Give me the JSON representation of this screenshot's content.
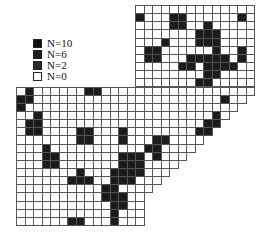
{
  "legend": [
    {
      "label": "N=10",
      "color": "#111111"
    },
    {
      "label": "N=6",
      "color": "#1e1e1e"
    },
    {
      "label": "N=2",
      "color": "#2a2a2a"
    },
    {
      "label": "N=0",
      "color": "#ffffff"
    }
  ],
  "grid": {
    "origin_x": 16,
    "origin_y": 5,
    "cell_w": 8.5,
    "cell_h": 8.15,
    "rows": [
      [
        14,
        27
      ],
      [
        14,
        27
      ],
      [
        14,
        27
      ],
      [
        14,
        27
      ],
      [
        14,
        27
      ],
      [
        14,
        27
      ],
      [
        14,
        27
      ],
      [
        14,
        27
      ],
      [
        14,
        27
      ],
      [
        14,
        27
      ],
      [
        0,
        27
      ],
      [
        0,
        26
      ],
      [
        0,
        25
      ],
      [
        0,
        24
      ],
      [
        0,
        23
      ],
      [
        0,
        22
      ],
      [
        0,
        21
      ],
      [
        0,
        20
      ],
      [
        0,
        19
      ],
      [
        0,
        18
      ],
      [
        0,
        17
      ],
      [
        0,
        16
      ],
      [
        0,
        15
      ],
      [
        0,
        14
      ],
      [
        0,
        14
      ],
      [
        0,
        14
      ],
      [
        0,
        14
      ]
    ],
    "dark": [
      [
        1,
        14
      ],
      [
        1,
        18
      ],
      [
        1,
        19
      ],
      [
        1,
        26
      ],
      [
        2,
        18
      ],
      [
        2,
        19
      ],
      [
        2,
        22
      ],
      [
        3,
        21
      ],
      [
        3,
        22
      ],
      [
        3,
        23
      ],
      [
        4,
        17
      ],
      [
        4,
        21
      ],
      [
        4,
        22
      ],
      [
        4,
        23
      ],
      [
        5,
        15
      ],
      [
        5,
        16
      ],
      [
        5,
        23
      ],
      [
        5,
        26
      ],
      [
        6,
        15
      ],
      [
        6,
        16
      ],
      [
        6,
        20
      ],
      [
        6,
        21
      ],
      [
        6,
        22
      ],
      [
        6,
        23
      ],
      [
        6,
        24
      ],
      [
        6,
        26
      ],
      [
        7,
        19
      ],
      [
        7,
        20
      ],
      [
        7,
        22
      ],
      [
        7,
        23
      ],
      [
        7,
        24
      ],
      [
        7,
        25
      ],
      [
        8,
        22
      ],
      [
        8,
        23
      ],
      [
        9,
        21
      ],
      [
        9,
        22
      ],
      [
        10,
        1
      ],
      [
        10,
        8
      ],
      [
        10,
        9
      ],
      [
        11,
        0
      ],
      [
        11,
        1
      ],
      [
        11,
        24
      ],
      [
        12,
        0
      ],
      [
        13,
        2
      ],
      [
        13,
        23
      ],
      [
        14,
        1
      ],
      [
        14,
        2
      ],
      [
        14,
        22
      ],
      [
        14,
        23
      ],
      [
        15,
        1
      ],
      [
        15,
        2
      ],
      [
        15,
        7
      ],
      [
        15,
        8
      ],
      [
        15,
        12
      ],
      [
        15,
        21
      ],
      [
        15,
        22
      ],
      [
        16,
        7
      ],
      [
        16,
        8
      ],
      [
        16,
        12
      ],
      [
        16,
        16
      ],
      [
        16,
        17
      ],
      [
        17,
        3
      ],
      [
        17,
        15
      ],
      [
        17,
        16
      ],
      [
        17,
        22
      ],
      [
        18,
        3
      ],
      [
        18,
        4
      ],
      [
        18,
        12
      ],
      [
        18,
        13
      ],
      [
        18,
        14
      ],
      [
        18,
        16
      ],
      [
        19,
        3
      ],
      [
        19,
        4
      ],
      [
        19,
        12
      ],
      [
        19,
        13
      ],
      [
        19,
        14
      ],
      [
        20,
        7
      ],
      [
        20,
        11
      ],
      [
        20,
        12
      ],
      [
        20,
        13
      ],
      [
        20,
        14
      ],
      [
        21,
        6
      ],
      [
        21,
        7
      ],
      [
        21,
        8
      ],
      [
        21,
        11
      ],
      [
        21,
        12
      ],
      [
        21,
        13
      ],
      [
        22,
        10
      ],
      [
        22,
        11
      ],
      [
        23,
        10
      ],
      [
        23,
        11
      ],
      [
        23,
        12
      ],
      [
        24,
        11
      ],
      [
        24,
        12
      ],
      [
        25,
        11
      ],
      [
        26,
        6
      ],
      [
        26,
        7
      ],
      [
        26,
        11
      ]
    ]
  }
}
